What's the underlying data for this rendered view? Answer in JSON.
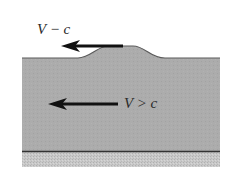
{
  "diagram": {
    "labels": {
      "surface_arrow": "V − c",
      "flow_arrow": "V > c"
    },
    "colors": {
      "background": "#ffffff",
      "water": "#a9a9a9",
      "surface_line": "#555555",
      "bottom_line": "#333333",
      "bed": "#c4c4c4",
      "arrow": "#111111",
      "text": "#2a2a2a"
    },
    "elements": [
      {
        "id": "water-layer",
        "kind": "region",
        "shape": "layer with smooth hump on top surface"
      },
      {
        "id": "surface-arrow",
        "kind": "arrow",
        "direction": "left",
        "label": "V − c",
        "position": "on top of hump"
      },
      {
        "id": "flow-arrow",
        "kind": "arrow",
        "direction": "left",
        "label": "V > c",
        "position": "mid-depth in water"
      },
      {
        "id": "channel-bottom",
        "kind": "line",
        "description": "bottom boundary with hatched bed below"
      }
    ]
  }
}
